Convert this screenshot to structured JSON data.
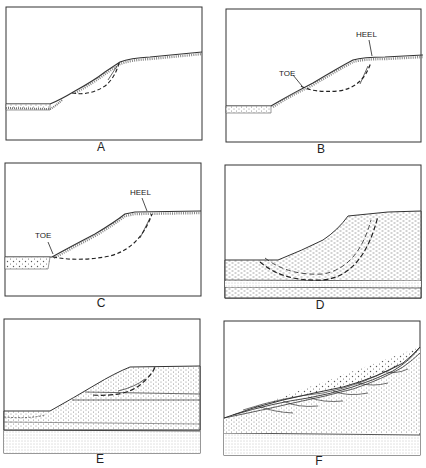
{
  "figure": {
    "panels": [
      {
        "id": "A",
        "label": "A",
        "annotations": []
      },
      {
        "id": "B",
        "label": "B",
        "annotations": [
          "TOE",
          "HEEL"
        ]
      },
      {
        "id": "C",
        "label": "C",
        "annotations": [
          "TOE",
          "HEEL"
        ]
      },
      {
        "id": "D",
        "label": "D",
        "annotations": []
      },
      {
        "id": "E",
        "label": "E",
        "annotations": []
      },
      {
        "id": "F",
        "label": "F",
        "annotations": []
      }
    ]
  },
  "colors": {
    "ink": "#2a2a2a",
    "paper": "#ffffff",
    "stipple": "#8a8a8a"
  }
}
